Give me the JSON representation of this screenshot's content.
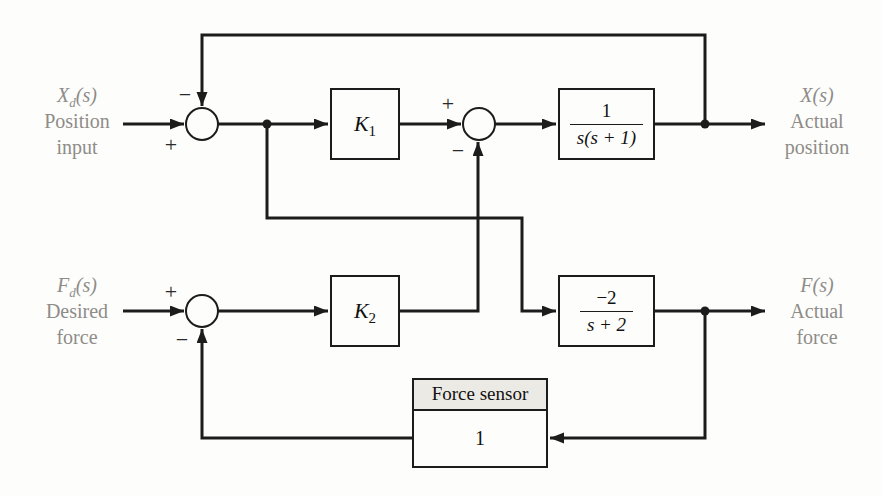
{
  "colors": {
    "background": "#fdfdfb",
    "line": "#1c1c1c",
    "label_gray": "#8e8c89",
    "sensor_header_bg": "#eceae5"
  },
  "inputs": {
    "position": {
      "math_base": "X",
      "math_sub": "d",
      "math_tail": "(s)",
      "line1": "Position",
      "line2": "input"
    },
    "force": {
      "math_base": "F",
      "math_sub": "d",
      "math_tail": "(s)",
      "line1": "Desired",
      "line2": "force"
    }
  },
  "outputs": {
    "position": {
      "math": "X(s)",
      "line1": "Actual",
      "line2": "position"
    },
    "force": {
      "math": "F(s)",
      "line1": "Actual",
      "line2": "force"
    }
  },
  "blocks": {
    "k1": {
      "base": "K",
      "sub": "1"
    },
    "k2": {
      "base": "K",
      "sub": "2"
    },
    "position_plant": {
      "num": "1",
      "den": "s(s + 1)"
    },
    "force_plant": {
      "num": "−2",
      "den": "s + 2"
    },
    "force_sensor": {
      "title": "Force sensor",
      "value": "1"
    }
  },
  "signs": {
    "sum_position": {
      "feedback": "−",
      "input": "+"
    },
    "sum_control": {
      "input": "+",
      "force": "−"
    },
    "sum_force": {
      "input": "+",
      "feedback": "−"
    }
  }
}
